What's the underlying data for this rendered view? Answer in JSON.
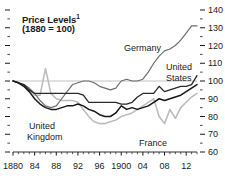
{
  "chart_data": {
    "type": "line",
    "title": "Price Levels",
    "title_footnote_marker": "1",
    "subtitle": "(1880 = 100)",
    "xlabel": "",
    "ylabel": "",
    "xlim": [
      1880,
      1914
    ],
    "ylim": [
      60,
      140
    ],
    "ytick_step": 10,
    "yticks": [
      60,
      70,
      80,
      90,
      100,
      110,
      120,
      130,
      140
    ],
    "ytick_labels": [
      "60",
      "70",
      "80",
      "90",
      "100",
      "110",
      "120",
      "130",
      "140"
    ],
    "y_minor_tick_step": 5,
    "xticks": [
      1880,
      1884,
      1888,
      1892,
      1896,
      1900,
      1904,
      1908,
      1912
    ],
    "xtick_labels": [
      "1880",
      "84",
      "88",
      "92",
      "96",
      "1900",
      "04",
      "08",
      "12"
    ],
    "x_minor_tick_step": 1,
    "grid": "horizontal-at-100-only",
    "legend": "inline-annotations",
    "axis_labels_position": "right",
    "x": [
      1880,
      1881,
      1882,
      1883,
      1884,
      1885,
      1886,
      1887,
      1888,
      1889,
      1890,
      1891,
      1892,
      1893,
      1894,
      1895,
      1896,
      1897,
      1898,
      1899,
      1900,
      1901,
      1902,
      1903,
      1904,
      1905,
      1906,
      1907,
      1908,
      1909,
      1910,
      1911,
      1912,
      1913,
      1914
    ],
    "series": [
      {
        "name": "Germany",
        "color": "#6e6e6e",
        "width": 1.2,
        "values": [
          100,
          99,
          98,
          96,
          93,
          89,
          86,
          85,
          86,
          90,
          94,
          98,
          99,
          100,
          100,
          99,
          97,
          96,
          95,
          96,
          100,
          101,
          100,
          100,
          101,
          105,
          110,
          114,
          117,
          118,
          120,
          123,
          127,
          131,
          131
        ]
      },
      {
        "name": "United States",
        "color": "#2a2a2a",
        "width": 1.3,
        "values": [
          100,
          99,
          98,
          95,
          93,
          93,
          93,
          93,
          93,
          93,
          93,
          93,
          93,
          92,
          88,
          88,
          88,
          88,
          88,
          88,
          87,
          87,
          88,
          91,
          93,
          93,
          93,
          97,
          94,
          95,
          96,
          97,
          97,
          98,
          103
        ]
      },
      {
        "name": "United Kingdom",
        "color": "#171717",
        "width": 1.5,
        "values": [
          100,
          99,
          97,
          94,
          90,
          87,
          85,
          84,
          84,
          85,
          86,
          86,
          87,
          86,
          84,
          83,
          81,
          80,
          80,
          82,
          86,
          84,
          85,
          84,
          85,
          86,
          88,
          90,
          89,
          90,
          91,
          92,
          94,
          96,
          98
        ]
      },
      {
        "name": "France",
        "color": "#bdbdbd",
        "width": 1.6,
        "values": [
          100,
          99,
          97,
          95,
          92,
          92,
          107,
          93,
          90,
          89,
          89,
          89,
          88,
          84,
          80,
          77,
          76,
          76,
          77,
          78,
          80,
          81,
          82,
          84,
          86,
          88,
          90,
          80,
          76,
          84,
          79,
          85,
          88,
          91,
          93
        ]
      }
    ]
  },
  "axis": {
    "y_labels": [
      "140",
      "130",
      "120",
      "110",
      "100",
      "90",
      "80",
      "70",
      "60"
    ],
    "x_labels": [
      "1880",
      "84",
      "88",
      "92",
      "96",
      "1900",
      "04",
      "08",
      "12"
    ]
  },
  "annotations": {
    "germany": "Germany",
    "united_states_line1": "United",
    "united_states_line2": "States",
    "united_kingdom_line1": "United",
    "united_kingdom_line2": "Kingdom",
    "france": "France"
  },
  "title": {
    "main": "Price Levels",
    "footnote": "1",
    "sub": "(1880 = 100)"
  },
  "colors": {
    "germany": "#6e6e6e",
    "united_states": "#2a2a2a",
    "united_kingdom": "#171717",
    "france": "#bdbdbd",
    "axis": "#1a1a1a",
    "gridline": "#a8a8a8",
    "background": "#ffffff"
  }
}
